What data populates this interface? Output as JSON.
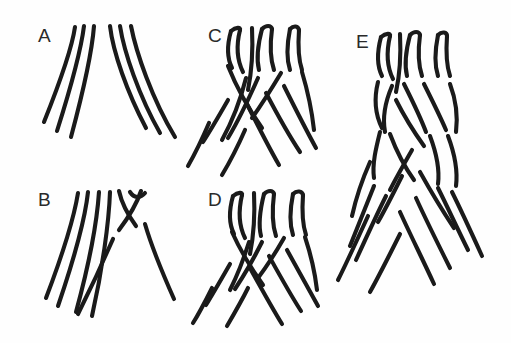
{
  "figure": {
    "background_color": "#fefefe",
    "stroke_color": "#1a1a1a",
    "stroke_width": 4.1,
    "width": 511,
    "height": 343,
    "panel_count": 5
  },
  "panels": [
    {
      "id": "A",
      "label": "A",
      "label_x": 38,
      "label_y": 42,
      "crossing_count": 0,
      "strand_count": 6,
      "description": "Six strands converge at a narrow apex and fan out symmetrically, three to the lower left and three to the lower right, with no crossings.",
      "strands": [
        "M 75 27 C 72 48, 60 82, 44 122",
        "M 84 26 C 81 50, 70 90, 57 131",
        "M 94 26 C 92 52, 82 96, 71 137",
        "M 110 26 C 113 52, 127 92, 146 128",
        "M 120 26 C 124 52, 139 96, 160 133",
        "M 131 26 C 136 52, 152 99, 175 137"
      ]
    },
    {
      "id": "B",
      "label": "B",
      "label_x": 38,
      "label_y": 206,
      "crossing_count": 1,
      "strand_count": 6,
      "description": "Five strands sweep down to the left while a single pair crosses near the top right, one strand passing under the other; a U-shaped bend caps the rightmost strand.",
      "strands": [
        "M 78 193 C 74 218, 62 256, 46 298",
        "M 88 192 C 85 220, 73 262, 58 306",
        "M 99 192 C 97 222, 88 268, 76 312",
        "M 110 192 C 109 222, 102 272, 92 316",
        "M 119 191 C 122 205, 128 215, 136 226",
        "M 145 224 C 152 248, 162 272, 174 299",
        "M 141 191 C 136 206, 128 218, 119 230",
        "M 113 239 C 103 262, 92 286, 78 314",
        "M 130 192 C 134 198, 140 199, 145 193"
      ]
    },
    {
      "id": "C",
      "label": "C",
      "label_x": 208,
      "label_y": 42,
      "crossing_count": 3,
      "strand_count": 6,
      "description": "Upper strands form looped bends and cross once in the upper region, then separate into left and right fans of three strands each below.",
      "strands": [
        "M 231 31 C 227 45, 227 58, 232 68",
        "M 240 30 C 236 46, 237 60, 243 72",
        "M 231 31 C 236 27, 241 27, 240 30",
        "M 262 29 C 258 44, 256 58, 259 70",
        "M 272 29 C 270 44, 270 58, 274 70",
        "M 262 29 C 266 25, 271 25, 272 29",
        "M 290 29 C 287 44, 286 58, 290 70",
        "M 299 30 C 298 44, 298 58, 302 70",
        "M 290 29 C 294 25, 298 26, 299 30",
        "M 252 28 C 253 48, 252 70, 248 90",
        "M 246 78 C 241 98, 233 120, 222 140",
        "M 228 66 C 236 86, 248 108, 262 128",
        "M 258 78 C 250 96, 240 118, 228 138",
        "M 281 73 C 272 88, 262 104, 252 118",
        "M 245 130 C 238 146, 231 160, 222 175",
        "M 266 93 C 276 112, 288 134, 300 152",
        "M 284 86 C 294 106, 305 128, 316 148",
        "M 247 104 C 257 124, 268 146, 279 165",
        "M 302 72 C 308 92, 312 112, 314 130",
        "M 209 123 C 203 137, 196 152, 188 166",
        "M 228 100 C 220 114, 212 128, 203 142"
      ]
    },
    {
      "id": "D",
      "label": "D",
      "label_x": 208,
      "label_y": 206,
      "crossing_count": 4,
      "strand_count": 6,
      "description": "Looped strand tops feed into two successive rows of crossings in the middle, with broken segments where strands pass under, then fan out below.",
      "strands": [
        "M 233 196 C 229 210, 229 224, 234 234",
        "M 242 195 C 238 212, 239 226, 245 238",
        "M 233 196 C 238 192, 243 192, 242 195",
        "M 264 194 C 260 210, 258 224, 261 236",
        "M 274 194 C 272 210, 272 224, 276 236",
        "M 264 194 C 268 190, 273 190, 274 194",
        "M 293 194 C 290 209, 289 223, 293 235",
        "M 303 195 C 302 209, 302 223, 306 235",
        "M 293 194 C 297 190, 302 191, 303 195",
        "M 254 193 C 255 213, 254 234, 250 254",
        "M 249 242 C 244 258, 238 274, 230 290",
        "M 232 232 C 240 250, 251 268, 263 285",
        "M 262 242 C 254 258, 245 274, 235 289",
        "M 284 238 C 276 252, 267 266, 258 278",
        "M 248 288 C 241 302, 234 314, 227 326",
        "M 269 256 C 279 274, 290 294, 301 311",
        "M 287 250 C 297 268, 308 288, 318 306",
        "M 250 268 C 260 286, 271 306, 282 324",
        "M 305 237 C 311 255, 315 273, 317 290",
        "M 212 288 C 206 300, 200 312, 193 323",
        "M 230 264 C 222 278, 214 292, 206 305"
      ]
    },
    {
      "id": "E",
      "label": "E",
      "label_x": 356,
      "label_y": 48,
      "crossing_count": 8,
      "strand_count": 6,
      "description": "The most complex panel: looped strand tops feed into several stacked rows of over-and-under crossings forming a braid, then all six strands fan widely to lower left and lower right.",
      "strands": [
        "M 381 37 C 377 52, 377 66, 382 76",
        "M 390 36 C 386 53, 387 67, 393 79",
        "M 381 37 C 386 33, 391 33, 390 36",
        "M 410 35 C 406 50, 404 64, 407 76",
        "M 420 35 C 418 50, 418 64, 422 76",
        "M 410 35 C 414 31, 419 31, 420 35",
        "M 438 35 C 435 50, 434 64, 438 76",
        "M 447 36 C 446 50, 446 64, 450 76",
        "M 438 35 C 442 31, 447 32, 447 36",
        "M 400 34 C 401 54, 400 74, 396 92",
        "M 378 82 C 374 98, 375 114, 382 128",
        "M 392 86 C 386 100, 382 116, 385 132",
        "M 404 84 C 412 100, 420 116, 426 132",
        "M 424 84 C 432 100, 440 116, 446 130",
        "M 450 84 C 456 100, 458 116, 456 132",
        "M 396 100 C 404 116, 414 132, 424 146",
        "M 390 134 C 396 150, 404 166, 414 180",
        "M 380 132 C 376 148, 372 164, 374 178",
        "M 430 136 C 436 152, 440 168, 438 184",
        "M 448 136 C 454 152, 458 170, 456 186",
        "M 412 150 C 404 164, 396 178, 390 190",
        "M 420 172 C 430 190, 442 210, 454 228",
        "M 402 176 C 394 192, 386 208, 378 222",
        "M 370 162 C 362 180, 356 198, 352 216",
        "M 438 188 C 448 208, 458 230, 468 250",
        "M 452 192 C 462 212, 472 234, 482 256",
        "M 386 196 C 376 216, 366 238, 356 260",
        "M 416 198 C 426 220, 438 244, 450 268",
        "M 400 212 C 410 234, 422 258, 434 284",
        "M 374 186 C 366 206, 358 226, 350 246",
        "M 368 216 C 358 238, 348 260, 338 280",
        "M 400 234 C 390 254, 380 274, 370 292"
      ]
    }
  ]
}
